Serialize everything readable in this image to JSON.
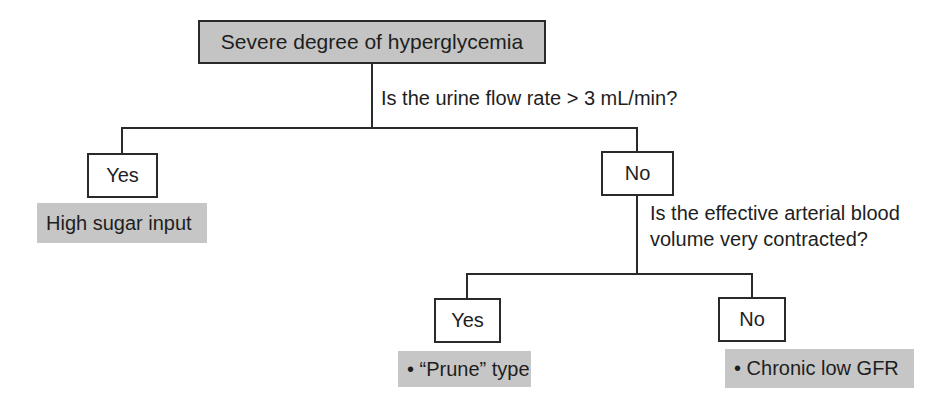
{
  "diagram": {
    "root": {
      "label": "Severe degree of hyperglycemia"
    },
    "question1": {
      "text": "Is the urine flow rate > 3 mL/min?"
    },
    "branch1_yes": {
      "label": "Yes",
      "result": "High sugar input"
    },
    "branch1_no": {
      "label": "No"
    },
    "question2": {
      "line1": "Is the effective arterial blood",
      "line2": "volume very contracted?"
    },
    "branch2_yes": {
      "label": "Yes",
      "result": "• “Prune” type"
    },
    "branch2_no": {
      "label": "No",
      "result": "• Chronic low GFR"
    },
    "colors": {
      "root_fill": "#c4c4c4",
      "result_fill": "#c6c6c6",
      "line": "#2a2a2a"
    }
  }
}
